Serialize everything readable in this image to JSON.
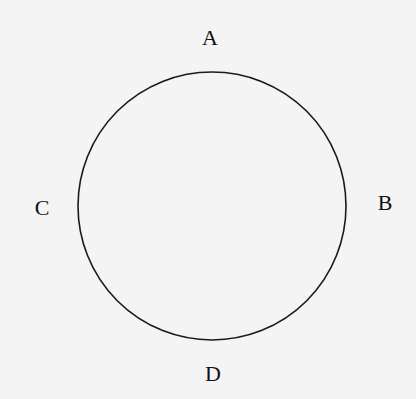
{
  "diagram": {
    "type": "circle-with-labeled-points",
    "circle": {
      "cx": 212,
      "cy": 206,
      "r": 134,
      "stroke": "#1a1a1a",
      "stroke_width": 1.6
    },
    "labels": [
      {
        "id": "A",
        "text": "A",
        "x": 210,
        "y": 38,
        "position": "top"
      },
      {
        "id": "B",
        "text": "B",
        "x": 385,
        "y": 203,
        "position": "right"
      },
      {
        "id": "C",
        "text": "C",
        "x": 42,
        "y": 208,
        "position": "left"
      },
      {
        "id": "D",
        "text": "D",
        "x": 213,
        "y": 374,
        "position": "bottom"
      }
    ],
    "background": "#f4f4f4",
    "text_color": "#111111"
  }
}
